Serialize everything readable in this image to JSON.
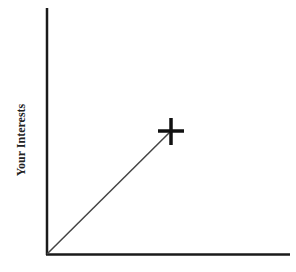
{
  "diagram": {
    "y_axis_label": "Your Interests",
    "x_axis_label": "",
    "marker": {
      "symbol": "plus",
      "x": 171,
      "y": 131
    },
    "origin": {
      "x": 47,
      "y": 254
    },
    "colors": {
      "axis": "#1a1a1a",
      "line": "#444444",
      "marker": "#111111",
      "background": "#ffffff"
    }
  }
}
